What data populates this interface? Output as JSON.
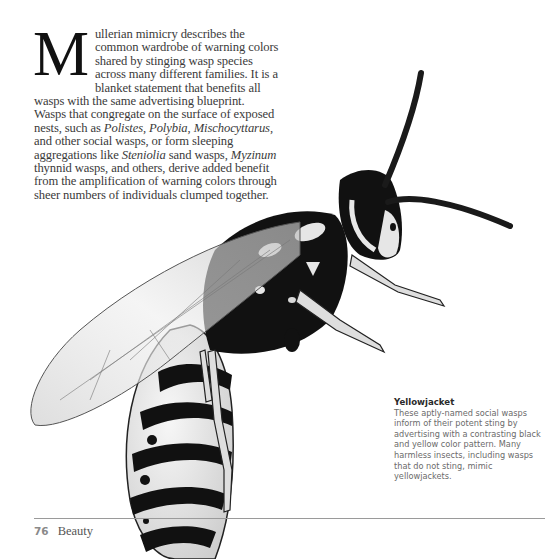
{
  "article": {
    "dropcap": "M",
    "lead": "ullerian mimicry describes the common wardrobe of warning colors shared by stinging wasp species across many different families. It is a blanket statement that benefits all wasps with the same advertising blueprint. Wasps that congregate on the surface of exposed nests, such as ",
    "genus_1": "Polistes",
    "sep_1": ", ",
    "genus_2": "Polybia",
    "sep_2": ", ",
    "genus_3": "Mischocyttarus",
    "mid": ", and other social wasps, or form sleeping aggregations like ",
    "genus_4": "Steniolia",
    "mid_2": " sand wasps, ",
    "genus_5": "Myzinum",
    "tail": " thynnid wasps, and others, derive added benefit from the amplification of warning colors through sheer numbers of individuals clumped together."
  },
  "caption": {
    "title": "Yellowjacket",
    "text": "These aptly-named social wasps inform of their potent sting by advertising with a contrasting black and yellow color pattern. Many harmless insects, including wasps that do not sting, mimic yellowjackets."
  },
  "footer": {
    "page_number": "76",
    "section": "Beauty"
  },
  "illustration": {
    "subject": "yellowjacket-wasp",
    "ink_color": "#111111",
    "pale_color": "#e8e8e8"
  }
}
